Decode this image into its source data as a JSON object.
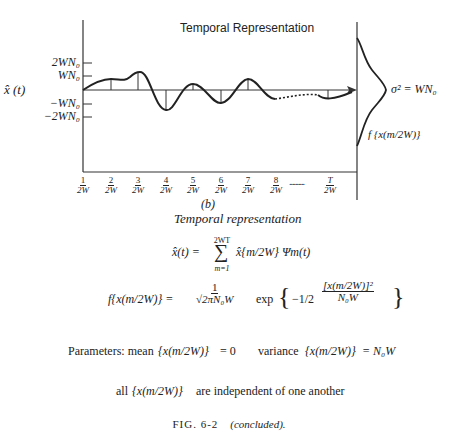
{
  "figure": {
    "title": "Temporal Representation",
    "panel_label": "(b)",
    "subtitle": "Temporal representation",
    "y_axis_label": "x̂ (t)",
    "y_ticks": [
      "2WN₀",
      "WN₀",
      "−WN₀",
      "−2WN₀"
    ],
    "x_ticks": [
      {
        "num": "1",
        "den": "2W"
      },
      {
        "num": "2",
        "den": "2W"
      },
      {
        "num": "3",
        "den": "2W"
      },
      {
        "num": "4",
        "den": "2W"
      },
      {
        "num": "5",
        "den": "2W"
      },
      {
        "num": "6",
        "den": "2W"
      },
      {
        "num": "7",
        "den": "2W"
      },
      {
        "num": "8",
        "den": "2W"
      },
      {
        "num": "T",
        "den": "2W"
      }
    ],
    "x_tick_ellipsis": "..........",
    "gaussian_variance_label": "σ² = WN₀",
    "gaussian_pdf_label": "f {x(m/2W)}"
  },
  "equations": {
    "series_lhs": "x̂(t) =",
    "series_sum_upper": "2WT",
    "series_sum_lower": "m=1",
    "series_rhs": "x̂{m/2W} Ψm(t)",
    "pdf_lhs": "f{x(m/2W)} =",
    "pdf_coeff_num": "1",
    "pdf_coeff_den": "√2πN₀W",
    "pdf_exp": "exp",
    "pdf_exponent_coeff": "−1/2",
    "pdf_exponent_num": "[x(m/2W)]²",
    "pdf_exponent_den": "N₀W",
    "params_label": "Parameters: mean",
    "params_mean_arg": "{x(m/2W)}",
    "params_mean_value": "= 0",
    "params_variance_label": "variance",
    "params_variance_arg": "{x(m/2W)}",
    "params_variance_value": "= N₀W",
    "independence_prefix": "all",
    "independence_arg": "{x(m/2W)}",
    "independence_suffix": "are independent of one another"
  },
  "caption": {
    "label": "FIG. 6-2",
    "note": "(concluded)."
  }
}
